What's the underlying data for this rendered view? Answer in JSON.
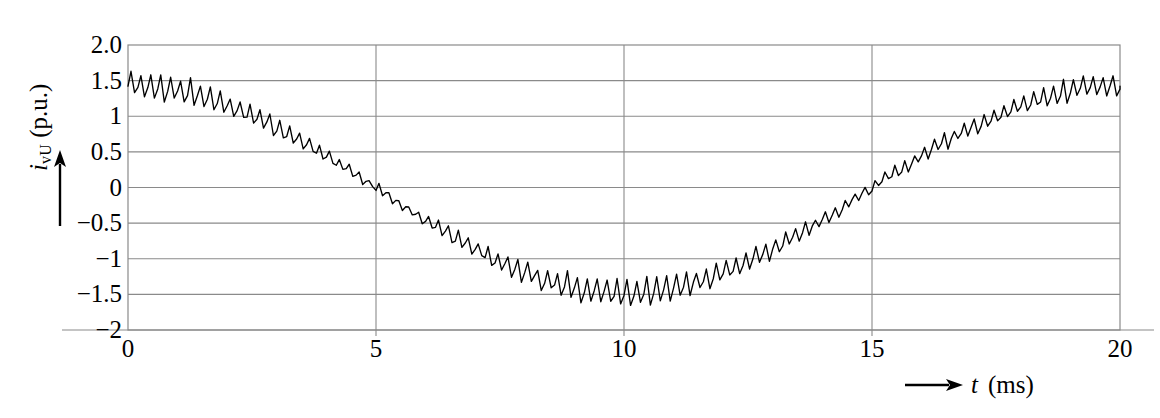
{
  "chart_data": {
    "type": "line",
    "title": "",
    "xlabel": "t",
    "xunit": "(ms)",
    "ylabel": "i",
    "ylabel_sub": "vU",
    "yunit": "(p.u.)",
    "xlim": [
      0,
      20
    ],
    "ylim": [
      -2,
      2
    ],
    "xticks": [
      0,
      5,
      10,
      15,
      20
    ],
    "xtick_labels": [
      "0",
      "5",
      "10",
      "15",
      "20"
    ],
    "yticks": [
      2.0,
      1.5,
      1.0,
      0.5,
      0.0,
      -0.5,
      -1.0,
      -1.5,
      -2.0
    ],
    "ytick_labels": [
      "2.0",
      "1.5",
      "1",
      "0.5",
      "0",
      "−0.5",
      "−1",
      "−1.5",
      "−2"
    ],
    "grid": {
      "horizontal": true,
      "vertical": true
    },
    "legend": null,
    "line_color": "#000000",
    "grid_color": "#8a8a8a",
    "frame_color": "#8a8a8a",
    "background": "#ffffff",
    "series": [
      {
        "name": "i_vU",
        "description": "Converter phase current with PWM switching ripple",
        "fundamental": {
          "waveform": "cosine",
          "amplitude": 1.45,
          "period_ms": 20.0,
          "frequency_hz": 50,
          "phase_deg": 0,
          "offset": 0.0
        },
        "ripple": {
          "waveform": "triangular",
          "switching_cycles": 100,
          "switching_frequency_hz": 5000,
          "amplitude_min": 0.09,
          "amplitude_max": 0.27
        },
        "key_points": [
          {
            "t": 0.0,
            "i": 1.45
          },
          {
            "t": 2.5,
            "i": 1.03
          },
          {
            "t": 5.0,
            "i": 0.0
          },
          {
            "t": 7.5,
            "i": -1.03
          },
          {
            "t": 10.0,
            "i": -1.45
          },
          {
            "t": 12.5,
            "i": -1.03
          },
          {
            "t": 15.0,
            "i": 0.0
          },
          {
            "t": 17.5,
            "i": 1.03
          },
          {
            "t": 20.0,
            "i": 1.45
          }
        ],
        "observed_min": -1.78,
        "observed_max": 1.62
      }
    ]
  },
  "plot_geometry": {
    "left": 128,
    "right": 1120,
    "top": 45,
    "bottom": 330
  }
}
